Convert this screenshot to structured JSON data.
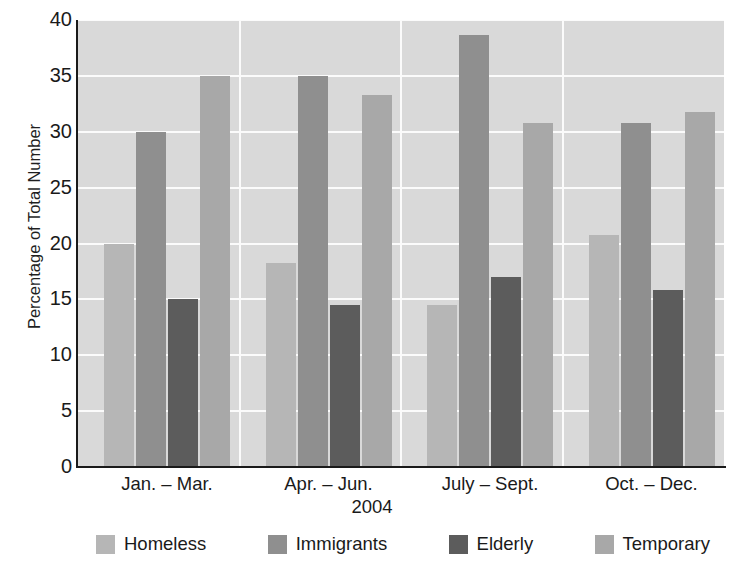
{
  "chart_data": {
    "type": "bar",
    "title": "",
    "xlabel": "2004",
    "ylabel": "Percentage of Total Number",
    "ylim": [
      0,
      40
    ],
    "yticks": [
      0,
      5,
      10,
      15,
      20,
      25,
      30,
      35,
      40
    ],
    "ytick_labels": [
      "0",
      "5",
      "10",
      "15",
      "20",
      "25",
      "30",
      "35",
      "40"
    ],
    "categories": [
      "Jan. – Mar.",
      "Apr. – Jun.",
      "July – Sept.",
      "Oct. – Dec."
    ],
    "grid": "horizontal-white",
    "legend_position": "bottom",
    "series": [
      {
        "name": "Homeless",
        "color": "#b6b6b6",
        "values": [
          20.0,
          18.3,
          14.5,
          20.8
        ]
      },
      {
        "name": "Immigrants",
        "color": "#8f8f8f",
        "values": [
          30.0,
          35.0,
          38.7,
          30.8
        ]
      },
      {
        "name": "Elderly",
        "color": "#5c5c5c",
        "values": [
          15.0,
          14.5,
          17.0,
          15.8
        ]
      },
      {
        "name": "Temporary",
        "color": "#a8a8a8",
        "values": [
          35.0,
          33.3,
          30.8,
          31.8
        ]
      }
    ]
  },
  "colors": {
    "plot_background": "#d9d9d9",
    "gridline": "#fbfbfb",
    "axis": "#1a1a1a",
    "page_background": "#ffffff"
  }
}
